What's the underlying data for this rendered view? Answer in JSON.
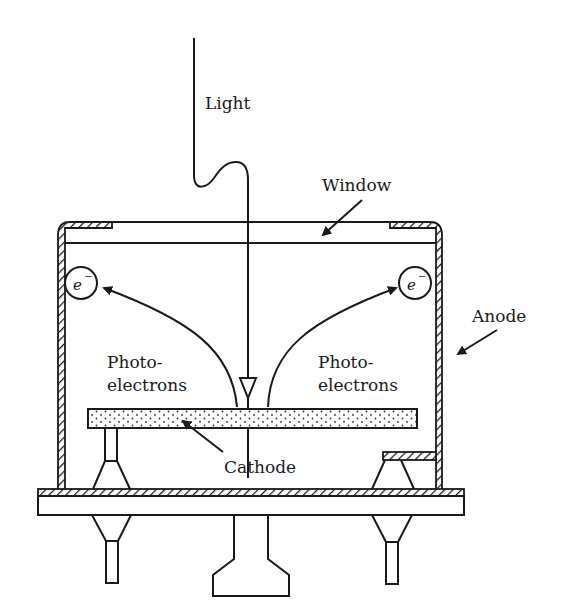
{
  "diagram": {
    "labels": {
      "light": "Light",
      "window": "Window",
      "anode": "Anode",
      "photoelectrons_left_1": "Photo-",
      "photoelectrons_left_2": "electrons",
      "photoelectrons_right_1": "Photo-",
      "photoelectrons_right_2": "electrons",
      "cathode": "Cathode",
      "electron_left": "e",
      "electron_right": "e",
      "electron_charge": "−"
    },
    "colors": {
      "stroke": "#1a1a1a",
      "background": "#ffffff"
    }
  }
}
